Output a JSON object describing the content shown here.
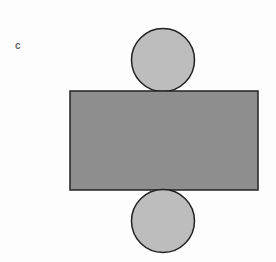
{
  "figure": {
    "label": "c",
    "colors": {
      "rectangle_fill": "#8e8e8e",
      "circle_fill": "#bdbdbd",
      "stroke": "#222222",
      "background": "#fdfdfd"
    }
  }
}
